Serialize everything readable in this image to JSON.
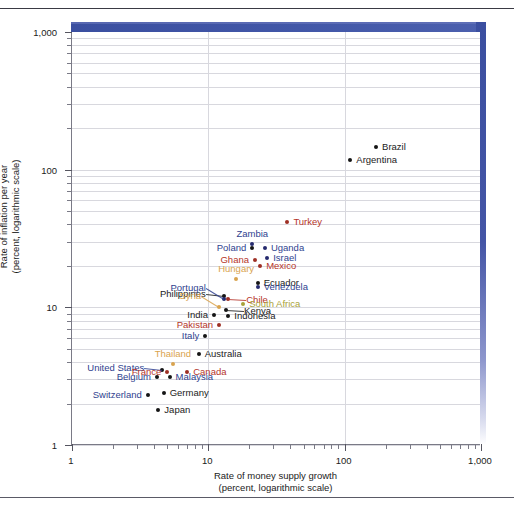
{
  "figure": {
    "axes": {
      "x": {
        "title_line1": "Rate of money supply growth",
        "title_line2": "(percent, logarithmic scale)",
        "ticks": [
          "1",
          "10",
          "100",
          "1,000"
        ]
      },
      "y": {
        "title_line1": "Rate of inflation per year",
        "title_line2": "(percent, logarithmic scale)",
        "ticks": [
          "1,000",
          "100",
          "10",
          "1"
        ]
      }
    },
    "colors": {
      "band": "#3b4fa0",
      "grid": "#d8d8de",
      "axis": "#7a7a86",
      "label_dark": "#1b1b1b",
      "label_blue": "#2f3f8f",
      "label_red": "#b5352a",
      "label_navy": "#252a6e",
      "label_tan": "#d9a34e",
      "label_olive": "#a9a23a",
      "point_black": "#151515",
      "point_red": "#9e2f24",
      "point_navy": "#252a6e",
      "point_tan": "#d9a34e"
    }
  },
  "chart_data": {
    "type": "scatter",
    "title": "",
    "xlabel": "Rate of money supply growth (percent, logarithmic scale)",
    "ylabel": "Rate of inflation per year (percent, logarithmic scale)",
    "xscale": "log",
    "yscale": "log",
    "xlim": [
      1,
      1000
    ],
    "ylim": [
      1,
      1000
    ],
    "grid": true,
    "legend": "none",
    "points": [
      {
        "name": "Brazil",
        "x": 170,
        "y": 145,
        "label_pos": "right",
        "color": "#1b1b1b",
        "dot": "#151515"
      },
      {
        "name": "Argentina",
        "x": 110,
        "y": 118,
        "label_pos": "right",
        "color": "#1b1b1b",
        "dot": "#151515"
      },
      {
        "name": "Turkey",
        "x": 38,
        "y": 42,
        "label_pos": "right",
        "color": "#b5352a",
        "dot": "#9e2f24"
      },
      {
        "name": "Zambia",
        "x": 21,
        "y": 29,
        "label_pos": "above",
        "color": "#2f3f8f",
        "dot": "#252a6e"
      },
      {
        "name": "Poland",
        "x": 21,
        "y": 27,
        "label_pos": "left",
        "color": "#2f3f8f",
        "dot": "#151515"
      },
      {
        "name": "Uganda",
        "x": 26,
        "y": 27,
        "label_pos": "right",
        "color": "#2f3f8f",
        "dot": "#252a6e"
      },
      {
        "name": "Israel",
        "x": 27,
        "y": 23,
        "label_pos": "right",
        "color": "#2f3f8f",
        "dot": "#252a6e"
      },
      {
        "name": "Ghana",
        "x": 22,
        "y": 22,
        "label_pos": "left",
        "color": "#b5352a",
        "dot": "#9e2f24"
      },
      {
        "name": "Mexico",
        "x": 24,
        "y": 20,
        "label_pos": "right",
        "color": "#b5352a",
        "dot": "#9e2f24"
      },
      {
        "name": "Hungary",
        "x": 16,
        "y": 16,
        "label_pos": "above",
        "color": "#d9a34e",
        "dot": "#d9a34e"
      },
      {
        "name": "Ecuador",
        "x": 23,
        "y": 15,
        "label_pos": "right",
        "color": "#1b1b1b",
        "dot": "#151515"
      },
      {
        "name": "Venezuela",
        "x": 23,
        "y": 14,
        "label_pos": "right",
        "color": "#2f3f8f",
        "dot": "#252a6e"
      },
      {
        "name": "Philippines",
        "x": 13,
        "y": 12,
        "label_pos": "leader-left",
        "color": "#1b1b1b",
        "dot": "#151515"
      },
      {
        "name": "Portugal",
        "x": 13,
        "y": 11.5,
        "label_pos": "leader-left",
        "color": "#2f3f8f",
        "dot": "#252a6e"
      },
      {
        "name": "Chile",
        "x": 14,
        "y": 11.5,
        "label_pos": "leader-right",
        "color": "#b5352a",
        "dot": "#9e2f24"
      },
      {
        "name": "South Africa",
        "x": 18,
        "y": 10.5,
        "label_pos": "right",
        "color": "#a9a23a",
        "dot": "#a9a23a"
      },
      {
        "name": "Syria",
        "x": 12,
        "y": 10,
        "label_pos": "leader-left",
        "color": "#d9a34e",
        "dot": "#d9a34e"
      },
      {
        "name": "Kenya",
        "x": 13.5,
        "y": 9.5,
        "label_pos": "leader-right",
        "color": "#1b1b1b",
        "dot": "#151515"
      },
      {
        "name": "India",
        "x": 11,
        "y": 8.8,
        "label_pos": "left",
        "color": "#1b1b1b",
        "dot": "#151515"
      },
      {
        "name": "Indonesia",
        "x": 14,
        "y": 8.6,
        "label_pos": "right",
        "color": "#1b1b1b",
        "dot": "#151515"
      },
      {
        "name": "Pakistan",
        "x": 12,
        "y": 7.4,
        "label_pos": "left",
        "color": "#b5352a",
        "dot": "#9e2f24"
      },
      {
        "name": "Italy",
        "x": 9.5,
        "y": 6.2,
        "label_pos": "left",
        "color": "#2f3f8f",
        "dot": "#151515"
      },
      {
        "name": "Australia",
        "x": 8.5,
        "y": 4.6,
        "label_pos": "right",
        "color": "#1b1b1b",
        "dot": "#151515"
      },
      {
        "name": "Thailand",
        "x": 5.5,
        "y": 3.9,
        "label_pos": "above",
        "color": "#d9a34e",
        "dot": "#d9a34e"
      },
      {
        "name": "United States",
        "x": 4.6,
        "y": 3.5,
        "label_pos": "leader-left",
        "color": "#2f3f8f",
        "dot": "#151515"
      },
      {
        "name": "France",
        "x": 5.0,
        "y": 3.4,
        "label_pos": "left",
        "color": "#b5352a",
        "dot": "#9e2f24"
      },
      {
        "name": "Canada",
        "x": 7.0,
        "y": 3.4,
        "label_pos": "right",
        "color": "#b5352a",
        "dot": "#9e2f24"
      },
      {
        "name": "Belgium",
        "x": 4.2,
        "y": 3.1,
        "label_pos": "left",
        "color": "#2f3f8f",
        "dot": "#151515"
      },
      {
        "name": "Malaysia",
        "x": 5.2,
        "y": 3.1,
        "label_pos": "right",
        "color": "#2f3f8f",
        "dot": "#151515"
      },
      {
        "name": "Germany",
        "x": 4.7,
        "y": 2.4,
        "label_pos": "right",
        "color": "#1b1b1b",
        "dot": "#151515"
      },
      {
        "name": "Switzerland",
        "x": 3.6,
        "y": 2.3,
        "label_pos": "left",
        "color": "#2f3f8f",
        "dot": "#151515"
      },
      {
        "name": "Japan",
        "x": 4.3,
        "y": 1.8,
        "label_pos": "right",
        "color": "#1b1b1b",
        "dot": "#151515"
      }
    ]
  }
}
